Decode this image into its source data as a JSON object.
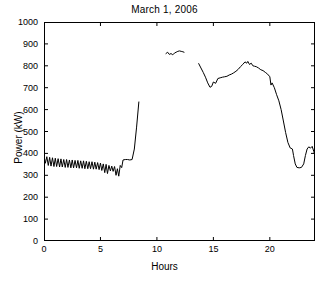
{
  "chart_data": {
    "type": "line",
    "title": "March 1, 2006",
    "xlabel": "Hours",
    "ylabel": "Power (kW)",
    "xlim": [
      0,
      24
    ],
    "ylim": [
      0,
      1000
    ],
    "xticks": [
      0,
      5,
      10,
      15,
      20
    ],
    "yticks": [
      0,
      100,
      200,
      300,
      400,
      500,
      600,
      700,
      800,
      900,
      1000
    ],
    "grid": false,
    "legend": null,
    "line_color": "#000000",
    "line_width": 1,
    "note": "Three disconnected segments with data gaps between hours 8.4-10.8 and 12.4-13.7",
    "series": [
      {
        "name": "Power segment 1 (00:00-08:24)",
        "x": [
          0.0,
          0.12,
          0.25,
          0.38,
          0.5,
          0.62,
          0.75,
          0.88,
          1.0,
          1.12,
          1.25,
          1.38,
          1.5,
          1.62,
          1.75,
          1.88,
          2.0,
          2.12,
          2.25,
          2.38,
          2.5,
          2.62,
          2.75,
          2.88,
          3.0,
          3.12,
          3.25,
          3.38,
          3.5,
          3.62,
          3.75,
          3.88,
          4.0,
          4.12,
          4.25,
          4.38,
          4.5,
          4.62,
          4.75,
          4.88,
          5.0,
          5.12,
          5.25,
          5.38,
          5.5,
          5.62,
          5.75,
          5.88,
          6.0,
          6.12,
          6.25,
          6.38,
          6.5,
          6.62,
          6.75,
          6.88,
          7.0,
          7.2,
          7.4,
          7.6,
          7.8,
          8.0,
          8.2,
          8.4
        ],
        "y": [
          390,
          355,
          385,
          345,
          382,
          342,
          380,
          340,
          378,
          340,
          376,
          338,
          375,
          338,
          372,
          336,
          372,
          336,
          370,
          334,
          370,
          334,
          368,
          334,
          368,
          332,
          366,
          332,
          366,
          330,
          364,
          330,
          362,
          330,
          362,
          328,
          360,
          328,
          358,
          326,
          356,
          322,
          352,
          312,
          350,
          308,
          345,
          320,
          342,
          318,
          340,
          300,
          330,
          296,
          345,
          335,
          370,
          372,
          372,
          370,
          372,
          420,
          520,
          635
        ]
      },
      {
        "name": "Power segment 2 (10:48-12:24)",
        "x": [
          10.8,
          10.95,
          11.1,
          11.25,
          11.4,
          11.55,
          11.7,
          11.85,
          12.0,
          12.15,
          12.3,
          12.4
        ],
        "y": [
          856,
          862,
          852,
          856,
          850,
          858,
          862,
          866,
          868,
          866,
          864,
          862
        ]
      },
      {
        "name": "Power segment 3 (13:42-24:00)",
        "x": [
          13.7,
          13.9,
          14.1,
          14.3,
          14.5,
          14.7,
          14.85,
          15.0,
          15.2,
          15.4,
          15.6,
          15.8,
          16.0,
          16.2,
          16.4,
          16.6,
          16.8,
          17.0,
          17.2,
          17.4,
          17.6,
          17.8,
          17.95,
          18.05,
          18.2,
          18.35,
          18.5,
          18.65,
          18.8,
          19.0,
          19.2,
          19.4,
          19.6,
          19.8,
          20.0,
          20.1,
          20.2,
          20.4,
          20.6,
          20.8,
          21.0,
          21.2,
          21.4,
          21.6,
          21.8,
          22.0,
          22.1,
          22.25,
          22.4,
          22.6,
          22.8,
          23.0,
          23.15,
          23.3,
          23.45,
          23.6,
          23.75,
          23.9,
          24.0
        ],
        "y": [
          810,
          790,
          770,
          748,
          722,
          702,
          706,
          726,
          720,
          742,
          745,
          748,
          750,
          752,
          758,
          762,
          768,
          775,
          784,
          796,
          806,
          818,
          812,
          820,
          806,
          812,
          800,
          798,
          796,
          790,
          782,
          778,
          770,
          762,
          750,
          712,
          722,
          700,
          668,
          640,
          600,
          548,
          495,
          450,
          425,
          420,
          390,
          352,
          336,
          334,
          336,
          352,
          390,
          420,
          430,
          424,
          432,
          408,
          385
        ]
      }
    ]
  },
  "axis": {
    "y_tick_labels": [
      "1000",
      "900",
      "800",
      "700",
      "600",
      "500",
      "400",
      "300",
      "200",
      "100",
      "0"
    ],
    "x_tick_labels": [
      "0",
      "5",
      "10",
      "15",
      "20"
    ]
  }
}
